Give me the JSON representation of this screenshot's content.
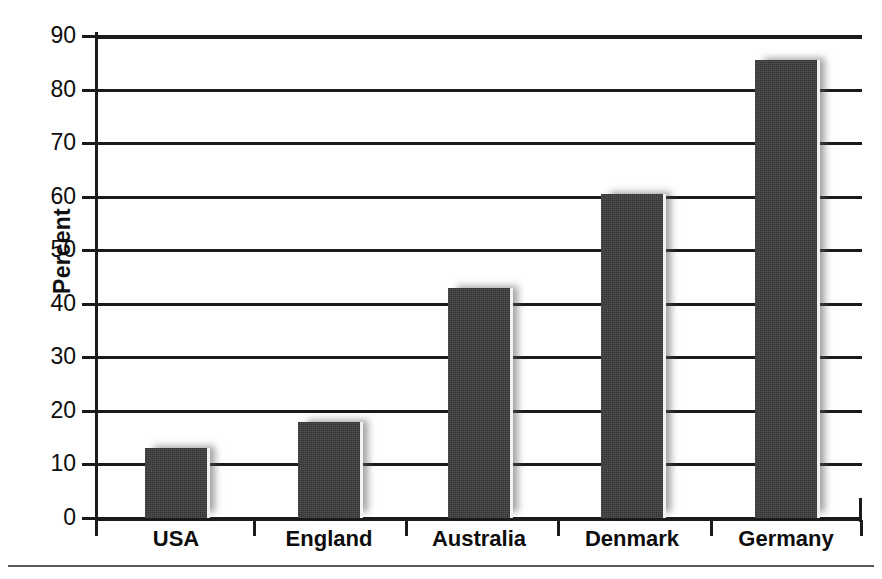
{
  "chart_data": {
    "type": "bar",
    "title": "",
    "xlabel": "",
    "ylabel": "Percent",
    "categories": [
      "USA",
      "England",
      "Australia",
      "Denmark",
      "Germany"
    ],
    "values": [
      13,
      18,
      43,
      60.5,
      85.5
    ],
    "ylim": [
      0,
      90
    ],
    "y_ticks": [
      0,
      10,
      20,
      30,
      40,
      50,
      60,
      70,
      80,
      90
    ],
    "y_tick_labels": [
      "0",
      "10",
      "20",
      "30",
      "40",
      "50",
      "60",
      "70",
      "80",
      "90"
    ],
    "grid": true,
    "legend": null,
    "orientation": "vertical",
    "bar_color": "#3b3b3b",
    "axis_color": "#1b1b1b",
    "background_color": "#ffffff"
  },
  "figure": {
    "axis_title_y": "Percent",
    "bottom_rule": ""
  }
}
